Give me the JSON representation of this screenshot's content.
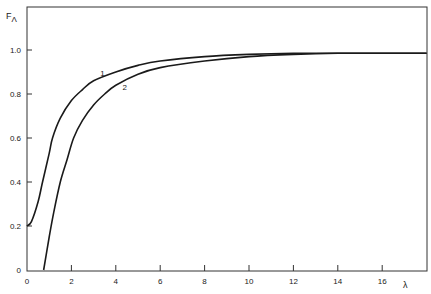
{
  "chart_data": {
    "type": "line",
    "title": "",
    "xlabel": "λ",
    "ylabel": "FΛ",
    "xlim": [
      0,
      18
    ],
    "ylim": [
      0,
      1.15
    ],
    "grid": false,
    "legend": "inline curve labels",
    "x_ticks": [
      0,
      2,
      4,
      6,
      8,
      10,
      12,
      14,
      16
    ],
    "x_tick_labels": [
      "0",
      "2",
      "4",
      "6",
      "8",
      "10",
      "12",
      "14",
      "16"
    ],
    "y_ticks": [
      0,
      0.2,
      0.4,
      0.6,
      0.8,
      1.0
    ],
    "y_tick_labels": [
      "0",
      "0.2",
      "0.4",
      "0.6",
      "0.8",
      "1.0"
    ],
    "series": [
      {
        "name": "1",
        "x": [
          0,
          0.2,
          0.5,
          0.7,
          1.0,
          1.15,
          1.5,
          2.0,
          2.5,
          3.0,
          4.0,
          5.0,
          6.0,
          8.0,
          10.0,
          12.0,
          14.0,
          16.0,
          18.0
        ],
        "y": [
          0.2,
          0.22,
          0.31,
          0.4,
          0.53,
          0.6,
          0.69,
          0.77,
          0.82,
          0.86,
          0.9,
          0.93,
          0.95,
          0.97,
          0.98,
          0.985,
          0.985,
          0.985,
          0.985
        ]
      },
      {
        "name": "2",
        "x": [
          0.75,
          1.0,
          1.2,
          1.5,
          1.8,
          2.1,
          2.5,
          3.0,
          3.5,
          4.0,
          5.0,
          6.0,
          8.0,
          10.0,
          12.0,
          14.0,
          16.0,
          18.0
        ],
        "y": [
          0.0,
          0.15,
          0.26,
          0.4,
          0.5,
          0.6,
          0.68,
          0.75,
          0.8,
          0.84,
          0.89,
          0.92,
          0.95,
          0.97,
          0.98,
          0.985,
          0.985,
          0.985
        ]
      }
    ],
    "annotations": [
      {
        "text": "1",
        "x": 3.3,
        "y": 0.88
      },
      {
        "text": "2",
        "x": 4.3,
        "y": 0.82
      }
    ]
  },
  "axes": {
    "y_label_main": "F",
    "y_label_sub": "Λ",
    "x_label": "λ"
  }
}
